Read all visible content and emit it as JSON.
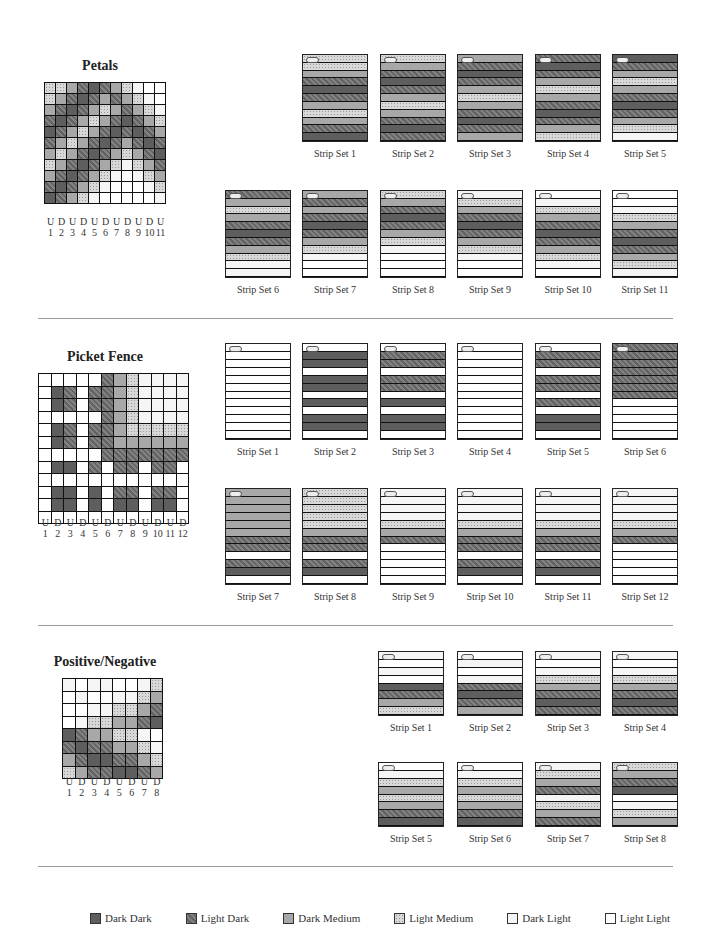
{
  "legend": [
    {
      "code": "DD",
      "label": "Dark Dark"
    },
    {
      "code": "LD",
      "label": "Light Dark"
    },
    {
      "code": "DM",
      "label": "Dark Medium"
    },
    {
      "code": "LM",
      "label": "Light Medium"
    },
    {
      "code": "DL",
      "label": "Dark Light"
    },
    {
      "code": "LL",
      "label": "Light Light"
    }
  ],
  "colors": {
    "DD": "#5e5e5e",
    "LD": "#707070",
    "DM": "#a8a8a8",
    "LM": "#d8d8d8",
    "DL": "#f5f5f5",
    "LL": "#ffffff"
  },
  "sections": [
    {
      "title": "Petals",
      "columns": [
        "U",
        "D",
        "U",
        "D",
        "U",
        "D",
        "U",
        "D",
        "U",
        "D",
        "U"
      ],
      "column_numbers": [
        "1",
        "2",
        "3",
        "4",
        "5",
        "6",
        "7",
        "8",
        "9",
        "10",
        "11"
      ],
      "grid": [
        [
          "LM",
          "LM",
          "DM",
          "LD",
          "DD",
          "LD",
          "DM",
          "LM",
          "DL",
          "LL",
          "LL"
        ],
        [
          "LM",
          "DM",
          "LD",
          "DD",
          "LD",
          "DM",
          "LD",
          "DM",
          "LM",
          "DL",
          "LL"
        ],
        [
          "DM",
          "LD",
          "DD",
          "LD",
          "DM",
          "LM",
          "DM",
          "LD",
          "DM",
          "LM",
          "DL"
        ],
        [
          "LD",
          "DD",
          "LD",
          "DM",
          "LM",
          "DM",
          "LD",
          "DD",
          "LD",
          "DM",
          "LM"
        ],
        [
          "DD",
          "LD",
          "DM",
          "LM",
          "DM",
          "LD",
          "DD",
          "LD",
          "DD",
          "LD",
          "DM"
        ],
        [
          "LD",
          "DM",
          "LM",
          "DM",
          "LD",
          "DD",
          "LD",
          "DM",
          "LD",
          "DD",
          "LD"
        ],
        [
          "DM",
          "LM",
          "DM",
          "LD",
          "DD",
          "LD",
          "DM",
          "LM",
          "DM",
          "LD",
          "DD"
        ],
        [
          "LM",
          "DM",
          "LD",
          "DD",
          "LD",
          "DM",
          "LM",
          "DL",
          "LM",
          "DM",
          "LD"
        ],
        [
          "DM",
          "LD",
          "DD",
          "LD",
          "DM",
          "LM",
          "DL",
          "LL",
          "DL",
          "LM",
          "DM"
        ],
        [
          "LD",
          "DD",
          "LD",
          "DM",
          "LM",
          "DL",
          "LL",
          "LL",
          "LL",
          "DL",
          "LM"
        ],
        [
          "DD",
          "LD",
          "DM",
          "LM",
          "DL",
          "LL",
          "LL",
          "LL",
          "LL",
          "LL",
          "DL"
        ]
      ],
      "strip_sets": [
        {
          "label": "Strip Set 1",
          "bands": [
            "LM",
            "LM",
            "DM",
            "LD",
            "DD",
            "LD",
            "DM",
            "LM",
            "DM",
            "LD",
            "DD"
          ]
        },
        {
          "label": "Strip Set 2",
          "bands": [
            "LM",
            "DM",
            "LD",
            "DD",
            "LD",
            "DM",
            "LM",
            "DM",
            "LD",
            "DD",
            "LD"
          ]
        },
        {
          "label": "Strip Set 3",
          "bands": [
            "DM",
            "LD",
            "DD",
            "LD",
            "DM",
            "LM",
            "DM",
            "LD",
            "DD",
            "LD",
            "DM"
          ]
        },
        {
          "label": "Strip Set 4",
          "bands": [
            "LD",
            "DD",
            "LD",
            "DM",
            "LM",
            "DM",
            "LD",
            "DD",
            "LD",
            "DM",
            "LM"
          ]
        },
        {
          "label": "Strip Set 5",
          "bands": [
            "DD",
            "LD",
            "DM",
            "LM",
            "DM",
            "LD",
            "DD",
            "LD",
            "DM",
            "LM",
            "DL"
          ]
        },
        {
          "label": "Strip Set 6",
          "bands": [
            "LD",
            "DM",
            "LM",
            "DM",
            "LD",
            "DD",
            "LD",
            "DM",
            "LM",
            "DL",
            "DL"
          ]
        },
        {
          "label": "Strip Set 7",
          "bands": [
            "DM",
            "LD",
            "DM",
            "LD",
            "DD",
            "LD",
            "DM",
            "LM",
            "DL",
            "LL",
            "LL"
          ]
        },
        {
          "label": "Strip Set 8",
          "bands": [
            "LM",
            "DM",
            "LD",
            "DD",
            "LD",
            "DM",
            "LM",
            "DL",
            "LL",
            "LL",
            "LL"
          ]
        },
        {
          "label": "Strip Set 9",
          "bands": [
            "DL",
            "LM",
            "DM",
            "LD",
            "DD",
            "LD",
            "DM",
            "LM",
            "DL",
            "LL",
            "LL"
          ]
        },
        {
          "label": "Strip Set 10",
          "bands": [
            "LL",
            "DL",
            "LM",
            "DM",
            "LD",
            "DD",
            "LD",
            "DM",
            "LM",
            "DL",
            "LL"
          ]
        },
        {
          "label": "Strip Set 11",
          "bands": [
            "LL",
            "LL",
            "DL",
            "LM",
            "DM",
            "LD",
            "DD",
            "LD",
            "DM",
            "LM",
            "DL"
          ]
        }
      ]
    },
    {
      "title": "Picket Fence",
      "columns": [
        "U",
        "D",
        "U",
        "D",
        "U",
        "D",
        "U",
        "D",
        "U",
        "D",
        "U",
        "D"
      ],
      "column_numbers": [
        "1",
        "2",
        "3",
        "4",
        "5",
        "6",
        "7",
        "8",
        "9",
        "10",
        "11",
        "12"
      ],
      "grid": [
        [
          "LL",
          "LL",
          "LL",
          "LL",
          "LL",
          "LD",
          "DM",
          "LM",
          "DL",
          "DL",
          "DL",
          "DL"
        ],
        [
          "LL",
          "DD",
          "LD",
          "LL",
          "LD",
          "LD",
          "DM",
          "LM",
          "DL",
          "DL",
          "DL",
          "DL"
        ],
        [
          "LL",
          "DD",
          "LD",
          "LL",
          "LD",
          "LD",
          "DM",
          "LM",
          "DL",
          "DL",
          "DL",
          "DL"
        ],
        [
          "LL",
          "LL",
          "LL",
          "LL",
          "LL",
          "LD",
          "DM",
          "LM",
          "DL",
          "DL",
          "DL",
          "DL"
        ],
        [
          "LL",
          "DD",
          "LD",
          "LL",
          "LD",
          "LD",
          "DM",
          "LM",
          "LM",
          "LM",
          "LM",
          "LM"
        ],
        [
          "LL",
          "DD",
          "LD",
          "LL",
          "LD",
          "LD",
          "DM",
          "DM",
          "DM",
          "DM",
          "DM",
          "DM"
        ],
        [
          "LL",
          "LL",
          "LL",
          "LL",
          "LL",
          "LD",
          "LD",
          "LD",
          "LD",
          "LD",
          "LD",
          "LD"
        ],
        [
          "LL",
          "DD",
          "DD",
          "LL",
          "LD",
          "LL",
          "LD",
          "LD",
          "LL",
          "LD",
          "LD",
          "LL"
        ],
        [
          "LL",
          "LL",
          "LL",
          "LL",
          "LL",
          "LL",
          "LL",
          "LL",
          "LL",
          "LL",
          "LL",
          "LL"
        ],
        [
          "LL",
          "DD",
          "DD",
          "LL",
          "DD",
          "LL",
          "LD",
          "LD",
          "LL",
          "LD",
          "LD",
          "LL"
        ],
        [
          "LL",
          "DD",
          "DD",
          "LL",
          "DD",
          "LL",
          "DD",
          "DD",
          "LL",
          "DD",
          "DD",
          "LL"
        ],
        [
          "LL",
          "LL",
          "LL",
          "LL",
          "LL",
          "LL",
          "LL",
          "LL",
          "LL",
          "LL",
          "LL",
          "LL"
        ]
      ],
      "strip_sets": [
        {
          "label": "Strip Set 1",
          "bands": [
            "LL",
            "LL",
            "LL",
            "LL",
            "LL",
            "LL",
            "LL",
            "LL",
            "LL",
            "LL",
            "LL",
            "LL"
          ]
        },
        {
          "label": "Strip Set 2",
          "bands": [
            "LL",
            "DD",
            "DD",
            "LL",
            "DD",
            "DD",
            "LL",
            "DD",
            "LL",
            "DD",
            "DD",
            "LL"
          ]
        },
        {
          "label": "Strip Set 3",
          "bands": [
            "LL",
            "LD",
            "LD",
            "LL",
            "LD",
            "LD",
            "LL",
            "DD",
            "LL",
            "DD",
            "DD",
            "LL"
          ]
        },
        {
          "label": "Strip Set 4",
          "bands": [
            "LL",
            "LL",
            "LL",
            "LL",
            "LL",
            "LL",
            "LL",
            "LL",
            "LL",
            "LL",
            "LL",
            "LL"
          ]
        },
        {
          "label": "Strip Set 5",
          "bands": [
            "LL",
            "LD",
            "LD",
            "LL",
            "LD",
            "LD",
            "LL",
            "LD",
            "LL",
            "DD",
            "DD",
            "LL"
          ]
        },
        {
          "label": "Strip Set 6",
          "bands": [
            "LD",
            "LD",
            "LD",
            "LD",
            "LD",
            "LD",
            "LD",
            "LL",
            "LL",
            "LL",
            "LL",
            "LL"
          ]
        },
        {
          "label": "Strip Set 7",
          "bands": [
            "DM",
            "DM",
            "DM",
            "DM",
            "DM",
            "DM",
            "LD",
            "LD",
            "LL",
            "LD",
            "DD",
            "LL"
          ]
        },
        {
          "label": "Strip Set 8",
          "bands": [
            "LM",
            "LM",
            "LM",
            "LM",
            "LM",
            "DM",
            "LD",
            "LD",
            "LL",
            "LD",
            "DD",
            "LL"
          ]
        },
        {
          "label": "Strip Set 9",
          "bands": [
            "DL",
            "DL",
            "DL",
            "DL",
            "LM",
            "DM",
            "LD",
            "LL",
            "LL",
            "LL",
            "LL",
            "LL"
          ]
        },
        {
          "label": "Strip Set 10",
          "bands": [
            "DL",
            "DL",
            "DL",
            "DL",
            "LM",
            "DM",
            "LD",
            "LD",
            "LL",
            "LD",
            "DD",
            "LL"
          ]
        },
        {
          "label": "Strip Set 11",
          "bands": [
            "DL",
            "DL",
            "DL",
            "DL",
            "LM",
            "DM",
            "LD",
            "LD",
            "LL",
            "LD",
            "DD",
            "LL"
          ]
        },
        {
          "label": "Strip Set 12",
          "bands": [
            "DL",
            "DL",
            "DL",
            "DL",
            "LM",
            "DM",
            "LD",
            "LL",
            "LL",
            "LL",
            "LL",
            "LL"
          ]
        }
      ]
    },
    {
      "title": "Positive/Negative",
      "columns": [
        "U",
        "D",
        "U",
        "D",
        "U",
        "D",
        "U",
        "D"
      ],
      "column_numbers": [
        "1",
        "2",
        "3",
        "4",
        "5",
        "6",
        "7",
        "8"
      ],
      "grid": [
        [
          "DL",
          "LL",
          "DL",
          "DL",
          "LL",
          "LL",
          "DL",
          "LM"
        ],
        [
          "LL",
          "DL",
          "LL",
          "LL",
          "DL",
          "DL",
          "LM",
          "DM"
        ],
        [
          "LL",
          "LL",
          "DL",
          "DL",
          "LM",
          "LM",
          "DM",
          "LD"
        ],
        [
          "LL",
          "DL",
          "LM",
          "LM",
          "DM",
          "DM",
          "LD",
          "DD"
        ],
        [
          "DD",
          "LD",
          "DM",
          "DM",
          "LM",
          "LM",
          "DL",
          "LL"
        ],
        [
          "LD",
          "DD",
          "LD",
          "LD",
          "DM",
          "DM",
          "LM",
          "DL"
        ],
        [
          "DM",
          "LD",
          "DD",
          "DD",
          "LD",
          "LD",
          "DM",
          "LM"
        ],
        [
          "LM",
          "DM",
          "LD",
          "LD",
          "DD",
          "DD",
          "LD",
          "DM"
        ]
      ],
      "strip_sets": [
        {
          "label": "Strip Set 1",
          "bands": [
            "DL",
            "LL",
            "DL",
            "LL",
            "DD",
            "LD",
            "DM",
            "LM"
          ]
        },
        {
          "label": "Strip Set 2",
          "bands": [
            "LL",
            "DL",
            "LL",
            "DL",
            "LD",
            "DD",
            "LD",
            "DM"
          ]
        },
        {
          "label": "Strip Set 3",
          "bands": [
            "DL",
            "LL",
            "DL",
            "LM",
            "DM",
            "LD",
            "DD",
            "LD"
          ]
        },
        {
          "label": "Strip Set 4",
          "bands": [
            "DL",
            "LL",
            "DL",
            "LM",
            "DM",
            "LD",
            "DD",
            "LD"
          ]
        },
        {
          "label": "Strip Set 5",
          "bands": [
            "LL",
            "DL",
            "LM",
            "DM",
            "LM",
            "DM",
            "LD",
            "DD"
          ]
        },
        {
          "label": "Strip Set 6",
          "bands": [
            "LL",
            "DL",
            "LM",
            "DM",
            "LM",
            "DM",
            "LD",
            "DD"
          ]
        },
        {
          "label": "Strip Set 7",
          "bands": [
            "DL",
            "LM",
            "DM",
            "LD",
            "DL",
            "LM",
            "DM",
            "LD"
          ]
        },
        {
          "label": "Strip Set 8",
          "bands": [
            "LM",
            "DM",
            "LD",
            "DD",
            "LL",
            "DL",
            "LM",
            "DM"
          ]
        }
      ]
    }
  ]
}
